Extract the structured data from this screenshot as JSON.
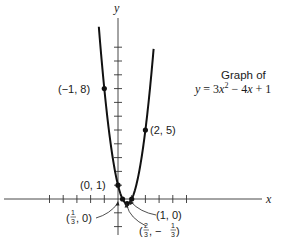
{
  "chart_data": {
    "type": "line",
    "equation": "y = 3x² − 4x + 1",
    "xlabel": "x",
    "ylabel": "y",
    "x_ticks": [
      -5,
      -4,
      -3,
      -2,
      -1,
      1,
      2,
      3,
      4,
      5
    ],
    "y_ticks": [
      -2,
      -1,
      1,
      2,
      3,
      4,
      5,
      6,
      7,
      8,
      9,
      10,
      11
    ],
    "xlim": [
      -8.5,
      12.2
    ],
    "ylim": [
      -2.5,
      13.5
    ],
    "grid": false,
    "legend": "none",
    "series": [
      {
        "name": "y = 3x^2 - 4x + 1",
        "function": "3*x^2 - 4*x + 1",
        "x_range": [
          -1.4,
          2.6
        ],
        "color": "#111111"
      }
    ],
    "points": [
      {
        "x": -1,
        "y": 8,
        "label": "(−1, 8)"
      },
      {
        "x": 2,
        "y": 5,
        "label": "(2, 5)"
      },
      {
        "x": 0,
        "y": 1,
        "label": "(0, 1)"
      },
      {
        "x": 0.3333,
        "y": 0,
        "label": "(1/3, 0)"
      },
      {
        "x": 1,
        "y": 0,
        "label": "(1, 0)"
      },
      {
        "x": 0.6667,
        "y": -0.3333,
        "label": "(2/3, −1/3)"
      }
    ]
  },
  "labels": {
    "y_axis": "y",
    "x_axis": "x",
    "caption_line1": "Graph of",
    "caption_eq_prefix": "y = 3",
    "caption_eq_x": "x",
    "caption_eq_sup": "2",
    "caption_eq_mid": " − 4",
    "caption_eq_x2": "x",
    "caption_eq_suffix": " + 1",
    "pt_m1_8": "(−1, 8)",
    "pt_2_5": "(2, 5)",
    "pt_0_1": "(0, 1)",
    "pt_1_0": "(1, 0)",
    "pt_third_open": "(",
    "pt_third_num": "1",
    "pt_third_den": "3",
    "pt_third_close": ", 0)",
    "pt_vert_open": "(",
    "pt_vert_num1": "2",
    "pt_vert_den1": "3",
    "pt_vert_mid": ", −",
    "pt_vert_num2": "1",
    "pt_vert_den2": "3",
    "pt_vert_close": ")"
  }
}
